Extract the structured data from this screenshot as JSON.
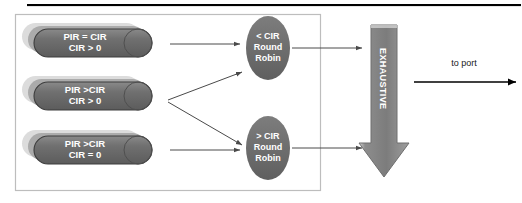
{
  "diagram": {
    "title_rule": "",
    "queues": [
      {
        "name": "queue-pir-eq-cir",
        "line1": "PIR = CIR",
        "line2": "CIR > 0"
      },
      {
        "name": "queue-pir-gt-cir-cir-gt-0",
        "line1": "PIR >CIR",
        "line2": "CIR > 0"
      },
      {
        "name": "queue-pir-gt-cir-cir-eq-0",
        "line1": "PIR >CIR",
        "line2": "CIR = 0"
      }
    ],
    "schedulers": [
      {
        "name": "scheduler-below-cir",
        "line1": "< CIR",
        "line2": "Round",
        "line3": "Robin"
      },
      {
        "name": "scheduler-above-cir",
        "line1": "> CIR",
        "line2": "Round",
        "line3": "Robin"
      }
    ],
    "exhaustive_arrow": {
      "label": "EXHAUSTIVE"
    },
    "output": {
      "label": "to port"
    },
    "colors": {
      "node_fill": "#6f6f6f",
      "node_fill_mid": "#a9a9a9",
      "node_fill_back": "#d9d9d9",
      "node_stroke": "#3d3d3d",
      "arrow_gray": "#8e8e8e",
      "arrow_black": "#000000",
      "connector": "#4a4a4a",
      "box_border": "#b9b9b9",
      "rule": "#000000",
      "text_light": "#ffffff",
      "text_dark": "#1a1a1a"
    }
  }
}
